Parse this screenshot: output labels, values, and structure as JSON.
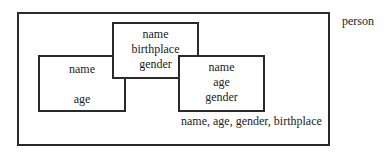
{
  "diagram": {
    "set_label": "person",
    "outer_box_label": "name, age, gender, birthplace",
    "boxes": [
      {
        "id": "left",
        "lines": [
          "name",
          "age"
        ]
      },
      {
        "id": "middle",
        "lines": [
          "name",
          "birthplace",
          "gender"
        ]
      },
      {
        "id": "right",
        "lines": [
          "name",
          "age",
          "gender"
        ]
      }
    ]
  }
}
